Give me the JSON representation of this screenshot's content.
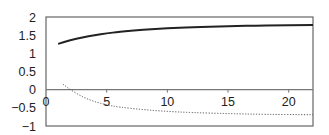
{
  "chart_data": {
    "type": "line",
    "title": "",
    "xlabel": "",
    "ylabel": "",
    "xlim": [
      0,
      22
    ],
    "ylim": [
      -1,
      2
    ],
    "grid": false,
    "legend": null,
    "x_ticks": [
      "0",
      "5",
      "10",
      "15",
      "20"
    ],
    "y_ticks": [
      "2",
      "1.5",
      "1",
      "0.5",
      "0",
      "-0.5",
      "-1"
    ],
    "series": [
      {
        "name": "upper curve (solid)",
        "style": "solid",
        "color": "#222222",
        "x": [
          1,
          2,
          3,
          4,
          5,
          6,
          8,
          10,
          12,
          15,
          18,
          22
        ],
        "y": [
          1.26,
          1.36,
          1.44,
          1.5,
          1.55,
          1.59,
          1.65,
          1.69,
          1.72,
          1.75,
          1.77,
          1.78
        ]
      },
      {
        "name": "lower curve (dotted)",
        "style": "dotted",
        "color": "#555555",
        "x": [
          1.4,
          2,
          3,
          4,
          5,
          6,
          8,
          10,
          12,
          15,
          18,
          22
        ],
        "y": [
          0.15,
          0.0,
          -0.2,
          -0.33,
          -0.42,
          -0.48,
          -0.55,
          -0.6,
          -0.63,
          -0.66,
          -0.68,
          -0.69
        ]
      }
    ]
  }
}
